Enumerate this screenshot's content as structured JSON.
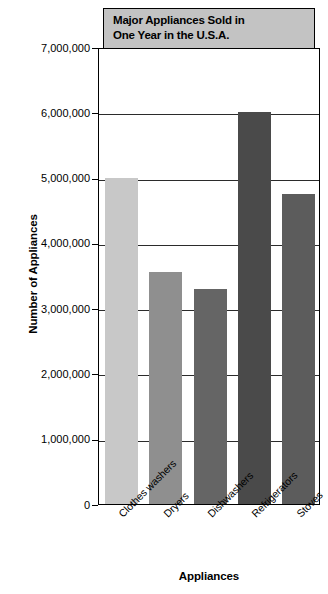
{
  "chart_data": {
    "type": "bar",
    "title": "Major Appliances Sold in One Year in the U.S.A.",
    "title_lines": [
      "Major Appliances Sold in",
      "One Year in the U.S.A."
    ],
    "xlabel": "Appliances",
    "ylabel": "Number of Appliances",
    "categories": [
      "Clothes washers",
      "Dryers",
      "Dishwashers",
      "Refrigerators",
      "Stoves"
    ],
    "values": [
      5000000,
      3550000,
      3300000,
      6000000,
      4750000
    ],
    "bar_colors": [
      "#c8c8c8",
      "#8f8f8f",
      "#656565",
      "#4a4a4a",
      "#5c5c5c"
    ],
    "ylim": [
      0,
      7000000
    ],
    "ytick_values": [
      0,
      1000000,
      2000000,
      3000000,
      4000000,
      5000000,
      6000000,
      7000000
    ],
    "ytick_labels": [
      "0",
      "1,000,000",
      "2,000,000",
      "3,000,000",
      "4,000,000",
      "5,000,000",
      "6,000,000",
      "7,000,000"
    ],
    "grid": true,
    "legend": false,
    "title_box_color": "#c3c3c3",
    "axis_color": "#000000"
  }
}
